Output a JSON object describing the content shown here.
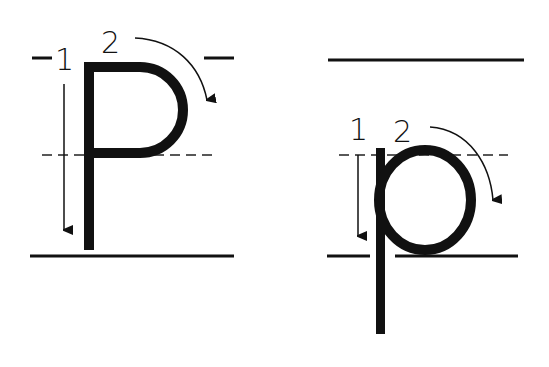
{
  "colors": {
    "ink": "#111111",
    "background": "#ffffff"
  },
  "uppercase": {
    "letter": "P",
    "step1_label": "1",
    "step2_label": "2",
    "step1_description": "straight line down",
    "step2_description": "curve around to the right"
  },
  "lowercase": {
    "letter": "p",
    "step1_label": "1",
    "step2_label": "2",
    "step1_description": "straight line down below baseline",
    "step2_description": "circle around to the right"
  },
  "guidelines": [
    "top-line",
    "midline-dashed",
    "baseline"
  ]
}
